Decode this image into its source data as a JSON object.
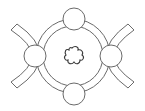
{
  "diagram": {
    "colors": {
      "background": "#ffffff",
      "stroke": "#6a6a6a",
      "center_stroke": "#3a3a3a"
    },
    "elements": {
      "outer_ring": {
        "cx": 73,
        "cy": 56,
        "r": 37
      },
      "inner_circle": {
        "cx": 73,
        "cy": 56,
        "r": 30
      },
      "small_circles": [
        {
          "position": "top",
          "cx": 74,
          "cy": 19,
          "r": 11
        },
        {
          "position": "bottom",
          "cx": 74,
          "cy": 94,
          "r": 11
        },
        {
          "position": "left",
          "cx": 35,
          "cy": 56,
          "r": 11
        },
        {
          "position": "right",
          "cx": 111,
          "cy": 56,
          "r": 11
        }
      ],
      "side_bands": [
        "left",
        "right"
      ],
      "center_shape": "flower"
    }
  }
}
